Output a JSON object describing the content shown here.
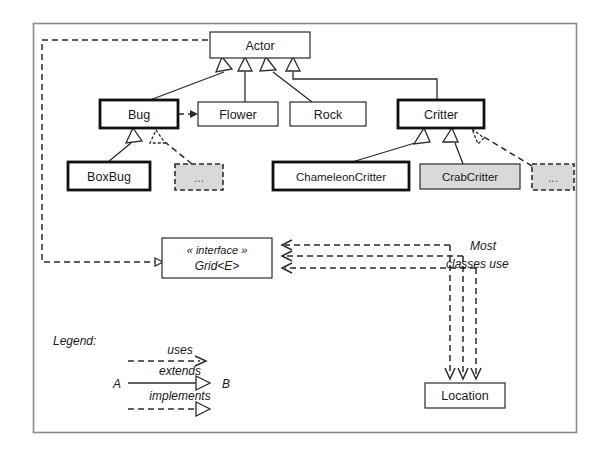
{
  "diagram": {
    "classes": [
      {
        "id": "actor",
        "label": "Actor",
        "style": "plain",
        "x": 210,
        "y": 32,
        "w": 100,
        "h": 26
      },
      {
        "id": "bug",
        "label": "Bug",
        "style": "bold",
        "x": 100,
        "y": 100,
        "w": 78,
        "h": 28
      },
      {
        "id": "flower",
        "label": "Flower",
        "style": "plain",
        "x": 198,
        "y": 102,
        "w": 80,
        "h": 24
      },
      {
        "id": "rock",
        "label": "Rock",
        "style": "plain",
        "x": 290,
        "y": 102,
        "w": 76,
        "h": 24
      },
      {
        "id": "critter",
        "label": "Critter",
        "style": "bold",
        "x": 398,
        "y": 100,
        "w": 86,
        "h": 28
      },
      {
        "id": "boxbug",
        "label": "BoxBug",
        "style": "bold",
        "x": 68,
        "y": 162,
        "w": 82,
        "h": 28
      },
      {
        "id": "bug-more",
        "label": "...",
        "style": "dashed",
        "x": 175,
        "y": 164,
        "w": 48,
        "h": 26
      },
      {
        "id": "chameleoncritter",
        "label": "ChameleonCritter",
        "style": "bold",
        "x": 273,
        "y": 162,
        "w": 136,
        "h": 28
      },
      {
        "id": "crabcritter",
        "label": "CrabCritter",
        "style": "gray",
        "x": 420,
        "y": 164,
        "w": 100,
        "h": 25
      },
      {
        "id": "critter-more",
        "label": "...",
        "style": "dashed",
        "x": 532,
        "y": 164,
        "w": 42,
        "h": 26
      },
      {
        "id": "location",
        "label": "Location",
        "style": "plain",
        "x": 425,
        "y": 383,
        "w": 80,
        "h": 25
      }
    ],
    "interface_box": {
      "id": "grid",
      "stereotype": "« interface »",
      "name": "Grid<E>",
      "x": 162,
      "y": 238,
      "w": 110,
      "h": 40
    },
    "annotations": {
      "most_classes_use_line1": "Most",
      "most_classes_use_line2": "classes use"
    },
    "legend": {
      "title": "Legend:",
      "uses_label": "uses",
      "extends_label": "extends",
      "implements_label": "implements",
      "source_label": "A",
      "target_label": "B"
    },
    "colors": {
      "background": "#ffffff",
      "line": "#2b2b2b",
      "frame": "#8a8a8a",
      "gray_fill": "#d9d9d9",
      "bold_stroke": "#111111"
    }
  }
}
